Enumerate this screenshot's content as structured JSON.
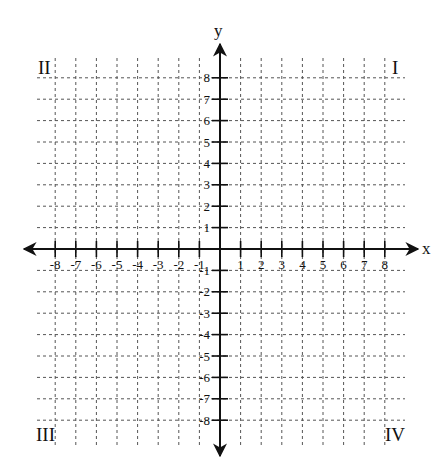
{
  "chart_data": {
    "type": "coordinate-plane",
    "title": "",
    "xlabel": "x",
    "ylabel": "y",
    "xlim": [
      -8,
      8
    ],
    "ylim": [
      -8,
      8
    ],
    "grid": true,
    "grid_style": "dashed",
    "x_ticks": [
      -8,
      -7,
      -6,
      -5,
      -4,
      -3,
      -2,
      -1,
      1,
      2,
      3,
      4,
      5,
      6,
      7,
      8
    ],
    "y_ticks": [
      -8,
      -7,
      -6,
      -5,
      -4,
      -3,
      -2,
      -1,
      1,
      2,
      3,
      4,
      5,
      6,
      7,
      8
    ],
    "quadrant_labels": {
      "I": "I",
      "II": "II",
      "III": "III",
      "IV": "IV"
    }
  },
  "colors": {
    "axis": "#111111",
    "grid": "#555555",
    "background": "#ffffff"
  }
}
